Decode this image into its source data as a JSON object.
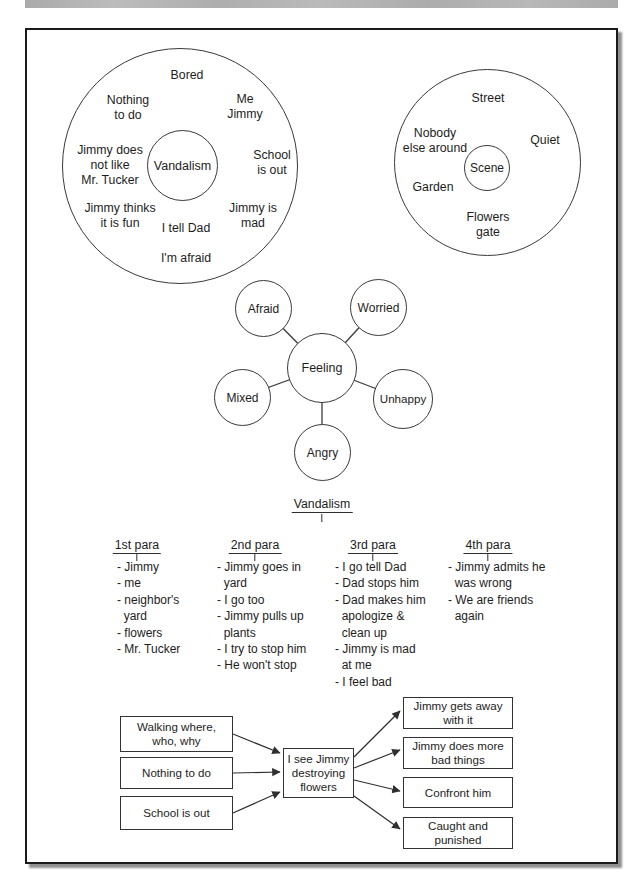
{
  "colors": {
    "ink": "#1d1d1d",
    "line": "#3a3a3a",
    "scan_bar": "#b3b3b3",
    "paper": "#ffffff"
  },
  "idea_web": {
    "center": "Vandalism",
    "items": [
      "Bored",
      "Nothing\nto do",
      "Me\nJimmy",
      "Jimmy does\nnot like\nMr. Tucker",
      "School\nis out",
      "Jimmy thinks\nit is fun",
      "I tell Dad",
      "Jimmy is\nmad",
      "I'm afraid"
    ]
  },
  "scene_web": {
    "center": "Scene",
    "items": [
      "Street",
      "Nobody\nelse around",
      "Quiet",
      "Garden",
      "Flowers\ngate"
    ]
  },
  "feeling_web": {
    "center": "Feeling",
    "satellites": [
      "Afraid",
      "Worried",
      "Mixed",
      "Unhappy",
      "Angry"
    ]
  },
  "outline": {
    "title": "Vandalism",
    "columns": [
      {
        "header": "1st para",
        "items": "- Jimmy\n- me\n- neighbor's\n  yard\n- flowers\n- Mr. Tucker"
      },
      {
        "header": "2nd para",
        "items": "- Jimmy goes in\n  yard\n- I go too\n- Jimmy pulls up\n  plants\n- I try to stop him\n- He won't stop"
      },
      {
        "header": "3rd para",
        "items": "- I go tell Dad\n- Dad stops him\n- Dad makes him\n  apologize &\n  clean up\n- Jimmy is mad\n  at me\n- I feel bad"
      },
      {
        "header": "4th para",
        "items": "- Jimmy admits he\n  was wrong\n- We are friends\n  again"
      }
    ]
  },
  "flowchart": {
    "causes": [
      "Walking where,\nwho, why",
      "Nothing to do",
      "School is out"
    ],
    "event": "I see Jimmy\ndestroying\nflowers",
    "outcomes": [
      "Jimmy gets away\nwith it",
      "Jimmy does more\nbad things",
      "Confront him",
      "Caught and\npunished"
    ]
  }
}
